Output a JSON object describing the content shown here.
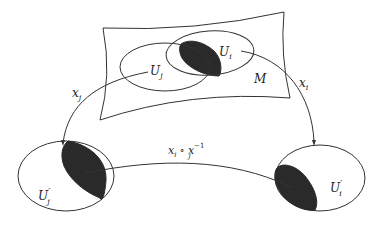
{
  "diagram": {
    "type": "manifold-charts-transition-map",
    "labels": {
      "manifold": "M",
      "chart_domain_i": "U",
      "chart_domain_i_sub": "i",
      "chart_domain_j": "U",
      "chart_domain_j_sub": "j",
      "image_j": "U",
      "image_j_prime": "′",
      "image_j_sub": "j",
      "image_i": "U",
      "image_i_prime": "′",
      "image_i_sub": "i",
      "map_j": "x",
      "map_j_sub": "j",
      "map_i": "x",
      "map_i_sub": "i",
      "transition_x": "x",
      "transition_x_sub": "i",
      "transition_op": "∘",
      "transition_y": "x",
      "transition_y_sub": "j",
      "transition_y_sup": "−1"
    },
    "colors": {
      "stroke": "#333333",
      "overlap_fill": "#2a2a2a",
      "background": "#ffffff"
    }
  }
}
